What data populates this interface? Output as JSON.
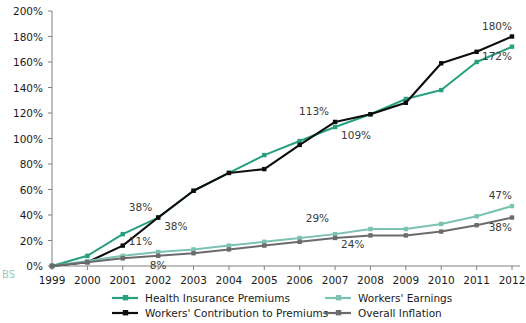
{
  "chart_data": {
    "type": "line",
    "title": "",
    "subtitle": "",
    "xlabel": "",
    "ylabel": "",
    "x": [
      1999,
      2000,
      2001,
      2002,
      2003,
      2004,
      2005,
      2006,
      2007,
      2008,
      2009,
      2010,
      2011,
      2012
    ],
    "xtick_labels": [
      "1999",
      "2000",
      "2001",
      "2002",
      "2003",
      "2004",
      "2005",
      "2006",
      "2007",
      "2008",
      "2009",
      "2010",
      "2011",
      "2012"
    ],
    "ylim": [
      0,
      200
    ],
    "ytick_values": [
      0,
      20,
      40,
      60,
      80,
      100,
      120,
      140,
      160,
      180,
      200
    ],
    "ytick_labels": [
      "0%",
      "20%",
      "40%",
      "60%",
      "80%",
      "100%",
      "120%",
      "140%",
      "160%",
      "180%",
      "200%"
    ],
    "grid": false,
    "legend_position": "bottom",
    "series": [
      {
        "name": "Health Insurance Premiums",
        "color": "#27a07f",
        "values": [
          0,
          8,
          25,
          38,
          59,
          73,
          87,
          98,
          109,
          119,
          131,
          138,
          160,
          172
        ]
      },
      {
        "name": "Workers' Contribution to Premiums",
        "color": "#0d0d0d",
        "values": [
          0,
          3,
          16,
          38,
          59,
          73,
          76,
          95,
          113,
          119,
          128,
          159,
          168,
          180
        ]
      },
      {
        "name": "Workers' Earnings",
        "color": "#7cc2b2",
        "values": [
          0,
          4,
          8,
          11,
          13,
          16,
          19,
          22,
          25,
          29,
          29,
          33,
          39,
          47
        ]
      },
      {
        "name": "Overall Inflation",
        "color": "#6b6b6b",
        "values": [
          0,
          3,
          6,
          8,
          10,
          13,
          16,
          19,
          22,
          24,
          24,
          27,
          32,
          38
        ]
      }
    ],
    "annotations": [
      {
        "text": "38%",
        "x": 2002,
        "y": 38,
        "series": "Workers' Contribution to Premiums",
        "placement": "above-left"
      },
      {
        "text": "38%",
        "x": 2002,
        "y": 38,
        "series": "Health Insurance Premiums",
        "placement": "below-right"
      },
      {
        "text": "11%",
        "x": 2002,
        "y": 11,
        "series": "Workers' Earnings",
        "placement": "above-left"
      },
      {
        "text": "8%",
        "x": 2002,
        "y": 8,
        "series": "Overall Inflation",
        "placement": "below"
      },
      {
        "text": "113%",
        "x": 2007,
        "y": 113,
        "series": "Workers' Contribution to Premiums",
        "placement": "above-left"
      },
      {
        "text": "109%",
        "x": 2007,
        "y": 109,
        "series": "Health Insurance Premiums",
        "placement": "below-right"
      },
      {
        "text": "29%",
        "x": 2007,
        "y": 29,
        "series": "Workers' Earnings",
        "placement": "above-left"
      },
      {
        "text": "24%",
        "x": 2008,
        "y": 24,
        "series": "Overall Inflation",
        "placement": "below-left"
      },
      {
        "text": "180%",
        "x": 2012,
        "y": 180,
        "series": "Workers' Contribution to Premiums",
        "placement": "above-left"
      },
      {
        "text": "172%",
        "x": 2012,
        "y": 172,
        "series": "Health Insurance Premiums",
        "placement": "below-left"
      },
      {
        "text": "47%",
        "x": 2012,
        "y": 47,
        "series": "Workers' Earnings",
        "placement": "above-left"
      },
      {
        "text": "38%",
        "x": 2012,
        "y": 38,
        "series": "Overall Inflation",
        "placement": "below-left"
      }
    ]
  },
  "legend": {
    "entries": [
      {
        "label": "Health Insurance Premiums",
        "color": "#27a07f"
      },
      {
        "label": "Workers' Earnings",
        "color": "#7cc2b2"
      },
      {
        "label": "Workers' Contribution to Premiums",
        "color": "#0d0d0d"
      },
      {
        "label": "Overall Inflation",
        "color": "#6b6b6b"
      }
    ]
  },
  "watermark": {
    "text": "BS"
  }
}
